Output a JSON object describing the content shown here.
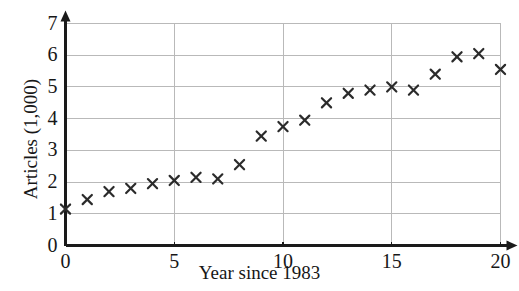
{
  "figure": {
    "background_color": "#ffffff",
    "axis_color": "#1a1a1a",
    "grid_color": "#b9b9b9",
    "marker_color": "#2b2b2b",
    "partial_top_text": ""
  },
  "chart_data": {
    "type": "scatter",
    "title": "",
    "xlabel": "Year since 1983",
    "ylabel": "Articles (1,000)",
    "xlim": [
      0,
      20
    ],
    "ylim": [
      0,
      7
    ],
    "xticks": [
      0,
      5,
      10,
      15,
      20
    ],
    "yticks": [
      0,
      1,
      2,
      3,
      4,
      5,
      6,
      7
    ],
    "xtick_labels": [
      "0",
      "5",
      "10",
      "15",
      "20"
    ],
    "ytick_labels": [
      "0",
      "1",
      "2",
      "3",
      "4",
      "5",
      "6",
      "7"
    ],
    "grid": true,
    "grid_axis": "both",
    "legend": false,
    "marker": "x",
    "x": [
      0,
      1,
      2,
      3,
      4,
      5,
      6,
      7,
      8,
      9,
      10,
      11,
      12,
      13,
      14,
      15,
      16,
      17,
      18,
      19,
      20
    ],
    "y": [
      1.15,
      1.45,
      1.7,
      1.8,
      1.95,
      2.05,
      2.15,
      2.1,
      2.55,
      3.45,
      3.75,
      3.95,
      4.5,
      4.8,
      4.9,
      5.0,
      4.9,
      5.4,
      5.95,
      6.05,
      5.55
    ],
    "points": [
      {
        "x": 0,
        "y": 1.15
      },
      {
        "x": 1,
        "y": 1.45
      },
      {
        "x": 2,
        "y": 1.7
      },
      {
        "x": 3,
        "y": 1.8
      },
      {
        "x": 4,
        "y": 1.95
      },
      {
        "x": 5,
        "y": 2.05
      },
      {
        "x": 6,
        "y": 2.15
      },
      {
        "x": 7,
        "y": 2.1
      },
      {
        "x": 8,
        "y": 2.55
      },
      {
        "x": 9,
        "y": 3.45
      },
      {
        "x": 10,
        "y": 3.75
      },
      {
        "x": 11,
        "y": 3.95
      },
      {
        "x": 12,
        "y": 4.5
      },
      {
        "x": 13,
        "y": 4.8
      },
      {
        "x": 14,
        "y": 4.9
      },
      {
        "x": 15,
        "y": 5.0
      },
      {
        "x": 16,
        "y": 4.9
      },
      {
        "x": 17,
        "y": 5.4
      },
      {
        "x": 18,
        "y": 5.95
      },
      {
        "x": 19,
        "y": 6.05
      },
      {
        "x": 20,
        "y": 5.55
      }
    ]
  }
}
